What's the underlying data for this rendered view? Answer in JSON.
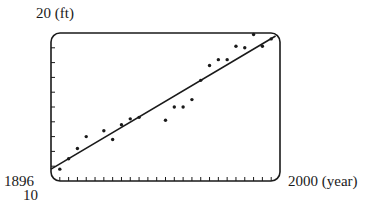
{
  "chart_data": {
    "type": "scatter",
    "title": "",
    "xlabel": "(year)",
    "ylabel": "(ft)",
    "xlim": [
      1896,
      2000
    ],
    "ylim": [
      10,
      20
    ],
    "x_tick_step": 4,
    "y_tick_step": 1,
    "grid": false,
    "legend": null,
    "labels": {
      "y_max": "20 (ft)",
      "y_min": "10",
      "x_min": "1896",
      "x_max": "2000 (year)"
    },
    "series": [
      {
        "name": "data",
        "kind": "scatter",
        "x": [
          1900,
          1904,
          1908,
          1912,
          1920,
          1924,
          1928,
          1932,
          1936,
          1948,
          1952,
          1956,
          1960,
          1964,
          1968,
          1972,
          1976,
          1980,
          1984,
          1988,
          1992,
          1996
        ],
        "y": [
          10.8,
          11.5,
          12.2,
          13.0,
          13.4,
          12.8,
          13.8,
          14.2,
          14.3,
          14.1,
          15.0,
          15.0,
          15.5,
          16.8,
          17.8,
          18.2,
          18.2,
          19.1,
          19.0,
          19.9,
          19.1,
          19.6
        ]
      },
      {
        "name": "regression line",
        "kind": "line",
        "x": [
          1896,
          1998
        ],
        "y": [
          10.8,
          19.8
        ]
      }
    ]
  },
  "geometry": {
    "frame": {
      "left": 51,
      "top": 33,
      "right": 280,
      "bottom": 181,
      "radius": 9
    },
    "colors": {
      "ink": "#1a1a1a",
      "background": "#ffffff"
    }
  }
}
